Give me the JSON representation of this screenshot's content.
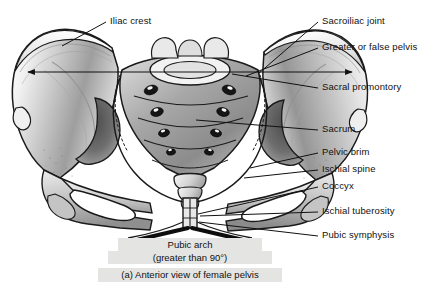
{
  "figure": {
    "title": "Anterior view of female pelvis",
    "background_color": "#ffffff",
    "ink_color": "#111111",
    "caption_band_color": "#e4e4e2",
    "width": 445,
    "height": 295
  },
  "labels": {
    "iliac_crest": "Iliac crest",
    "sacroiliac_joint": "Sacroiliac joint",
    "greater_or_false_pelvis": "Greater or false pelvis",
    "sacral_promontory": "Sacral promontory",
    "sacrum": "Sacrum",
    "pelvic_brim": "Pelvic brim",
    "ischial_spine": "Ischial spine",
    "coccyx": "Coccyx",
    "ischial_tuberosity": "Ischial tuberosity",
    "pubic_symphysis": "Pubic symphysis"
  },
  "annotations": {
    "pubic_arch_line1": "Pubic arch",
    "pubic_arch_line2": "(greater than 90°)",
    "figure_caption": "(a)  Anterior view of female pelvis"
  },
  "structures": {
    "left_ilium": "left-ilium",
    "right_ilium": "right-ilium",
    "sacrum_body": "sacrum",
    "coccyx_body": "coccyx",
    "pubic_symphysis_joint": "pubic-symphysis",
    "left_obturator_foramen": "left-obturator-foramen",
    "right_obturator_foramen": "right-obturator-foramen",
    "pelvic_inlet": "pelvic-inlet",
    "false_pelvis_width_arrow": "double-headed-width-arrow"
  }
}
